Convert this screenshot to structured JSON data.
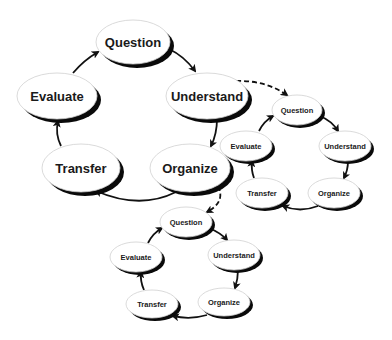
{
  "diagram": {
    "type": "nested-cycle",
    "colors": {
      "background": "#ffffff",
      "node_fill": "#ffffff",
      "node_shadow": "#0a0a0a",
      "edge": "#111111",
      "text": "#1a1a1a"
    },
    "cycles": [
      {
        "id": "main",
        "font_size": 13,
        "nodes": [
          {
            "id": "q",
            "label": "Question",
            "cx": 133,
            "cy": 42,
            "rx": 37,
            "ry": 22
          },
          {
            "id": "u",
            "label": "Understand",
            "cx": 207,
            "cy": 96,
            "rx": 41,
            "ry": 23
          },
          {
            "id": "o",
            "label": "Organize",
            "cx": 190,
            "cy": 168,
            "rx": 40,
            "ry": 24
          },
          {
            "id": "t",
            "label": "Transfer",
            "cx": 81,
            "cy": 168,
            "rx": 39,
            "ry": 24
          },
          {
            "id": "e",
            "label": "Evaluate",
            "cx": 57,
            "cy": 96,
            "rx": 40,
            "ry": 23
          }
        ]
      },
      {
        "id": "right",
        "font_size": 7.5,
        "nodes": [
          {
            "id": "q",
            "label": "Question",
            "cx": 297,
            "cy": 110,
            "rx": 25,
            "ry": 15
          },
          {
            "id": "u",
            "label": "Understand",
            "cx": 345,
            "cy": 146,
            "rx": 26,
            "ry": 15
          },
          {
            "id": "o",
            "label": "Organize",
            "cx": 334,
            "cy": 193,
            "rx": 26,
            "ry": 15
          },
          {
            "id": "t",
            "label": "Transfer",
            "cx": 262,
            "cy": 193,
            "rx": 26,
            "ry": 15
          },
          {
            "id": "e",
            "label": "Evaluate",
            "cx": 246,
            "cy": 146,
            "rx": 26,
            "ry": 15
          }
        ]
      },
      {
        "id": "bottom",
        "font_size": 7.5,
        "nodes": [
          {
            "id": "q",
            "label": "Question",
            "cx": 186,
            "cy": 222,
            "rx": 26,
            "ry": 15
          },
          {
            "id": "u",
            "label": "Understand",
            "cx": 234,
            "cy": 255,
            "rx": 26,
            "ry": 15
          },
          {
            "id": "o",
            "label": "Organize",
            "cx": 224,
            "cy": 302,
            "rx": 26,
            "ry": 14
          },
          {
            "id": "t",
            "label": "Transfer",
            "cx": 152,
            "cy": 304,
            "rx": 26,
            "ry": 14
          },
          {
            "id": "e",
            "label": "Evaluate",
            "cx": 136,
            "cy": 257,
            "rx": 26,
            "ry": 15
          }
        ]
      }
    ],
    "cycle_order": [
      "Question",
      "Understand",
      "Organize",
      "Transfer",
      "Evaluate"
    ],
    "dashed_links": [
      {
        "from": "main.Understand",
        "to": "right.Question"
      },
      {
        "from": "main.Organize",
        "to": "bottom.Question"
      }
    ]
  }
}
